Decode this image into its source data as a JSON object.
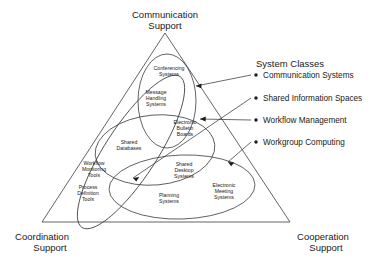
{
  "diagram": {
    "corners": {
      "top": {
        "line1": "Communication",
        "line2": "Support"
      },
      "bottom_left": {
        "line1": "Coordination",
        "line2": "Support"
      },
      "bottom_right": {
        "line1": "Cooperation",
        "line2": "Support"
      }
    },
    "inner_groups": [
      {
        "id": "conferencing-systems",
        "lines": [
          "Conferencing",
          "Systems"
        ]
      },
      {
        "id": "message-handling-systems",
        "lines": [
          "Message",
          "Handling",
          "Systems"
        ]
      },
      {
        "id": "electronic-bulletin-boards",
        "lines": [
          "Electronic",
          "Bulletin",
          "Boards"
        ]
      },
      {
        "id": "shared-databases",
        "lines": [
          "Shared",
          "Databases"
        ]
      },
      {
        "id": "workflow-monitoring-tools",
        "lines": [
          "Workflow",
          "Monitoring",
          "Tools"
        ]
      },
      {
        "id": "process-definition-tools",
        "lines": [
          "Process",
          "Definition",
          "Tools"
        ]
      },
      {
        "id": "shared-desktop-systems",
        "lines": [
          "Shared",
          "Desktop",
          "Systems"
        ]
      },
      {
        "id": "planning-systems",
        "lines": [
          "Planning",
          "Systems"
        ]
      },
      {
        "id": "electronic-meeting-systems",
        "lines": [
          "Electronic",
          "Meeting",
          "Systems"
        ]
      }
    ],
    "legend": {
      "title": "System Classes",
      "items": [
        {
          "id": "communication-systems",
          "label": "Communication Systems"
        },
        {
          "id": "shared-information-spaces",
          "label": "Shared Information Spaces"
        },
        {
          "id": "workflow-management",
          "label": "Workflow Management"
        },
        {
          "id": "workgroup-computing",
          "label": "Workgroup Computing"
        }
      ]
    },
    "colors": {
      "background": "#ffffff",
      "stroke": "#3c3c3c",
      "text": "#1a1a1a",
      "leader": "#2b2b2b"
    }
  }
}
